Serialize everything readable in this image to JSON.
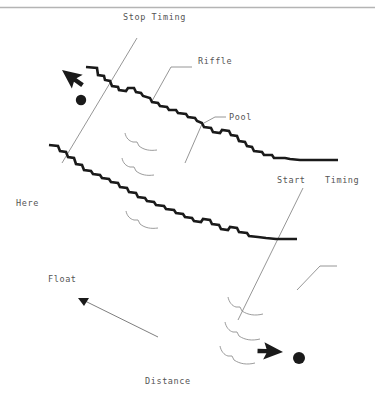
{
  "figure": {
    "type": "stream-reach-sketch-map",
    "background_color": "#ffffff",
    "width": 375,
    "height": 402,
    "top_rule_color": "#b4b4b4",
    "bank_line_color": "#1a1a1a",
    "thin_line_color": "#8a8a8a",
    "text_color": "#555555",
    "cursor_color": "#1a1a1a"
  },
  "labels": {
    "stop_timing": "Stop Timing",
    "riffle": "Riffle",
    "pool": "Pool",
    "start": "Start",
    "timing": "Timing",
    "here": "Here",
    "float": "Float",
    "distance": "Distance"
  },
  "annotations": {
    "leader_riffle": "riffle-leader-line",
    "leader_pool": "pool-leader-line",
    "leader_start": "start-leader-line",
    "leader_timing": "timing-leader-line",
    "transect_stop": "stop-timing-transect",
    "transect_start": "start-timing-transect",
    "float_arrow": "float-direction-arrow"
  },
  "cursors": [
    {
      "name": "cursor-upper-left",
      "x": 62,
      "y": 70,
      "rotation": -28
    },
    {
      "name": "cursor-lower-right",
      "x": 283,
      "y": 352,
      "rotation": 118
    }
  ],
  "dots": [
    {
      "name": "click-dot-upper-left",
      "cx": 81,
      "cy": 100,
      "r": 5.2
    },
    {
      "name": "click-dot-lower-right",
      "cx": 299,
      "cy": 358,
      "r": 6.0
    }
  ],
  "banks": {
    "upper_bank": "stepped-upper-bank-line",
    "lower_bank": "stepped-lower-bank-line"
  },
  "current_marks": {
    "mid_channel": "flow-hook-marks-mid-channel",
    "lower_right": "flow-hook-marks-lower-right"
  }
}
